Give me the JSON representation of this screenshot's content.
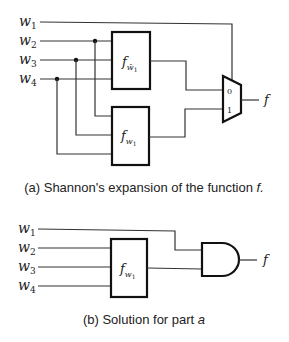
{
  "diagram_a": {
    "inputs": [
      "w",
      "w",
      "w",
      "w"
    ],
    "input_subscripts": [
      "1",
      "2",
      "3",
      "4"
    ],
    "block_top": {
      "func": "f",
      "sub": "w̄",
      "subsub": "1"
    },
    "block_bottom": {
      "func": "f",
      "sub": "w",
      "subsub": "1"
    },
    "mux_inputs": [
      "0",
      "1"
    ],
    "output": "f",
    "caption_prefix": "(a) Shannon's expansion of the function ",
    "caption_var": "f."
  },
  "diagram_b": {
    "inputs": [
      "w",
      "w",
      "w",
      "w"
    ],
    "input_subscripts": [
      "1",
      "2",
      "3",
      "4"
    ],
    "block": {
      "func": "f",
      "sub": "w",
      "subsub": "1"
    },
    "gate": "AND",
    "output": "f",
    "caption_prefix": "(b) Solution for part ",
    "caption_var": "a"
  }
}
